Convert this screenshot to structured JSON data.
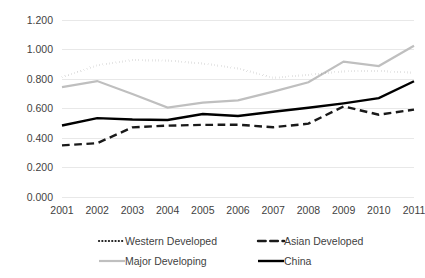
{
  "chart_data": {
    "type": "line",
    "title": "",
    "subtitle": "",
    "xlabel": "",
    "ylabel": "",
    "grid": true,
    "legend_position": "bottom",
    "xlim": [
      2001,
      2011
    ],
    "ylim": [
      0.0,
      1.2
    ],
    "x": [
      2001,
      2002,
      2003,
      2004,
      2005,
      2006,
      2007,
      2008,
      2009,
      2010,
      2011
    ],
    "xtick_labels": [
      "2001",
      "2002",
      "2003",
      "2004",
      "2005",
      "2006",
      "2007",
      "2008",
      "2009",
      "2010",
      "2011"
    ],
    "ytick_labels": [
      "0.000",
      "0.200",
      "0.400",
      "0.600",
      "0.800",
      "1.000",
      "1.200"
    ],
    "ytick_values": [
      0.0,
      0.2,
      0.4,
      0.6,
      0.8,
      1.0,
      1.2
    ],
    "series": [
      {
        "name": "Western Developed",
        "style": "dotted",
        "color": "#1a1a1a",
        "width": 2.2,
        "values": [
          0.812,
          0.893,
          0.928,
          0.925,
          0.905,
          0.872,
          0.808,
          0.828,
          0.852,
          0.855,
          0.842
        ]
      },
      {
        "name": "Asian Developed",
        "style": "dashed",
        "color": "#1a1a1a",
        "width": 2.4,
        "values": [
          0.35,
          0.365,
          0.472,
          0.484,
          0.489,
          0.49,
          0.473,
          0.497,
          0.614,
          0.558,
          0.592
        ]
      },
      {
        "name": "Major Developing",
        "style": "solid",
        "color": "#bfbfbf",
        "width": 2.2,
        "values": [
          0.745,
          0.786,
          0.698,
          0.606,
          0.64,
          0.655,
          0.714,
          0.778,
          0.918,
          0.888,
          1.025
        ]
      },
      {
        "name": "China",
        "style": "solid",
        "color": "#000000",
        "width": 2.4,
        "values": [
          0.485,
          0.535,
          0.525,
          0.522,
          0.563,
          0.549,
          0.578,
          0.605,
          0.635,
          0.67,
          0.785
        ]
      }
    ]
  },
  "legend": {
    "entries": [
      {
        "label": "Western Developed"
      },
      {
        "label": "Asian Developed"
      },
      {
        "label": "Major Developing"
      },
      {
        "label": "China"
      }
    ]
  }
}
